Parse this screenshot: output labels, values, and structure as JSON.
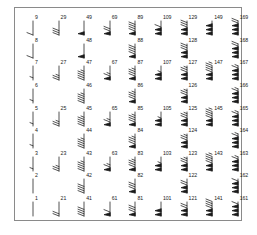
{
  "figure": {
    "kind": "wind-barb-grid",
    "frame_color": "#8a8a8a",
    "background_color": "#ffffff",
    "barb_color": "#1a1a1a",
    "label_color": "#1a1a1a"
  },
  "chart_data": {
    "type": "scatter",
    "title": "",
    "subtitle": "",
    "xlabel": "",
    "ylabel": "",
    "grid": false,
    "legend": "none",
    "xlim": [
      0,
      9
    ],
    "ylim": [
      0,
      9
    ],
    "xticks": [],
    "yticks": [],
    "marker": "wind-barb",
    "annotation_note": "Each marker is a meteorological wind barb labelled with its index value. Index increases bottom-to-top within a column and by 20 across columns.",
    "columns": [
      {
        "col": 1,
        "base": 1,
        "dense": true
      },
      {
        "col": 2,
        "base": 21,
        "dense": false
      },
      {
        "col": 3,
        "base": 41,
        "dense": true
      },
      {
        "col": 4,
        "base": 61,
        "dense": false
      },
      {
        "col": 5,
        "base": 81,
        "dense": true
      },
      {
        "col": 6,
        "base": 101,
        "dense": false
      },
      {
        "col": 7,
        "base": 121,
        "dense": true
      },
      {
        "col": 8,
        "base": 141,
        "dense": false
      },
      {
        "col": 9,
        "base": 161,
        "dense": true
      }
    ],
    "rows": [
      {
        "row": 9,
        "offset": 8,
        "labels": [
          9,
          29,
          49,
          69,
          89,
          109,
          129,
          149,
          169
        ]
      },
      {
        "row": 8,
        "offset": 7,
        "labels": [
          8,
          null,
          48,
          null,
          88,
          null,
          128,
          null,
          168
        ]
      },
      {
        "row": 7,
        "offset": 6,
        "labels": [
          7,
          27,
          47,
          67,
          87,
          107,
          127,
          147,
          167
        ]
      },
      {
        "row": 6,
        "offset": 5,
        "labels": [
          6,
          null,
          46,
          null,
          86,
          null,
          126,
          null,
          166
        ]
      },
      {
        "row": 5,
        "offset": 4,
        "labels": [
          5,
          25,
          45,
          65,
          85,
          105,
          125,
          145,
          165
        ]
      },
      {
        "row": 4,
        "offset": 3,
        "labels": [
          4,
          null,
          44,
          null,
          84,
          null,
          124,
          null,
          164
        ]
      },
      {
        "row": 3,
        "offset": 2,
        "labels": [
          3,
          23,
          43,
          63,
          83,
          103,
          123,
          143,
          163
        ]
      },
      {
        "row": 2,
        "offset": 1,
        "labels": [
          2,
          null,
          42,
          null,
          82,
          null,
          122,
          null,
          162
        ]
      },
      {
        "row": 1,
        "offset": 0,
        "labels": [
          1,
          21,
          41,
          61,
          81,
          101,
          121,
          141,
          161
        ]
      }
    ],
    "points": [
      {
        "label": "9",
        "col": 1,
        "row": 9,
        "speed": 9
      },
      {
        "label": "29",
        "col": 2,
        "row": 9,
        "speed": 29
      },
      {
        "label": "49",
        "col": 3,
        "row": 9,
        "speed": 49
      },
      {
        "label": "69",
        "col": 4,
        "row": 9,
        "speed": 69
      },
      {
        "label": "89",
        "col": 5,
        "row": 9,
        "speed": 89
      },
      {
        "label": "109",
        "col": 6,
        "row": 9,
        "speed": 109
      },
      {
        "label": "129",
        "col": 7,
        "row": 9,
        "speed": 129
      },
      {
        "label": "149",
        "col": 8,
        "row": 9,
        "speed": 149
      },
      {
        "label": "169",
        "col": 9,
        "row": 9,
        "speed": 169
      },
      {
        "label": "8",
        "col": 1,
        "row": 8,
        "speed": 8
      },
      {
        "label": "48",
        "col": 3,
        "row": 8,
        "speed": 48
      },
      {
        "label": "88",
        "col": 5,
        "row": 8,
        "speed": 88
      },
      {
        "label": "128",
        "col": 7,
        "row": 8,
        "speed": 128
      },
      {
        "label": "168",
        "col": 9,
        "row": 8,
        "speed": 168
      },
      {
        "label": "7",
        "col": 1,
        "row": 7,
        "speed": 7
      },
      {
        "label": "27",
        "col": 2,
        "row": 7,
        "speed": 27
      },
      {
        "label": "47",
        "col": 3,
        "row": 7,
        "speed": 47
      },
      {
        "label": "67",
        "col": 4,
        "row": 7,
        "speed": 67
      },
      {
        "label": "87",
        "col": 5,
        "row": 7,
        "speed": 87
      },
      {
        "label": "107",
        "col": 6,
        "row": 7,
        "speed": 107
      },
      {
        "label": "127",
        "col": 7,
        "row": 7,
        "speed": 127
      },
      {
        "label": "147",
        "col": 8,
        "row": 7,
        "speed": 147
      },
      {
        "label": "167",
        "col": 9,
        "row": 7,
        "speed": 167
      },
      {
        "label": "6",
        "col": 1,
        "row": 6,
        "speed": 6
      },
      {
        "label": "46",
        "col": 3,
        "row": 6,
        "speed": 46
      },
      {
        "label": "86",
        "col": 5,
        "row": 6,
        "speed": 86
      },
      {
        "label": "126",
        "col": 7,
        "row": 6,
        "speed": 126
      },
      {
        "label": "166",
        "col": 9,
        "row": 6,
        "speed": 166
      },
      {
        "label": "5",
        "col": 1,
        "row": 5,
        "speed": 5
      },
      {
        "label": "25",
        "col": 2,
        "row": 5,
        "speed": 25
      },
      {
        "label": "45",
        "col": 3,
        "row": 5,
        "speed": 45
      },
      {
        "label": "65",
        "col": 4,
        "row": 5,
        "speed": 65
      },
      {
        "label": "85",
        "col": 5,
        "row": 5,
        "speed": 85
      },
      {
        "label": "105",
        "col": 6,
        "row": 5,
        "speed": 105
      },
      {
        "label": "125",
        "col": 7,
        "row": 5,
        "speed": 125
      },
      {
        "label": "145",
        "col": 8,
        "row": 5,
        "speed": 145
      },
      {
        "label": "165",
        "col": 9,
        "row": 5,
        "speed": 165
      },
      {
        "label": "4",
        "col": 1,
        "row": 4,
        "speed": 4
      },
      {
        "label": "44",
        "col": 3,
        "row": 4,
        "speed": 44
      },
      {
        "label": "84",
        "col": 5,
        "row": 4,
        "speed": 84
      },
      {
        "label": "124",
        "col": 7,
        "row": 4,
        "speed": 124
      },
      {
        "label": "164",
        "col": 9,
        "row": 4,
        "speed": 164
      },
      {
        "label": "3",
        "col": 1,
        "row": 3,
        "speed": 3
      },
      {
        "label": "23",
        "col": 2,
        "row": 3,
        "speed": 23
      },
      {
        "label": "43",
        "col": 3,
        "row": 3,
        "speed": 43
      },
      {
        "label": "63",
        "col": 4,
        "row": 3,
        "speed": 63
      },
      {
        "label": "83",
        "col": 5,
        "row": 3,
        "speed": 83
      },
      {
        "label": "103",
        "col": 6,
        "row": 3,
        "speed": 103
      },
      {
        "label": "123",
        "col": 7,
        "row": 3,
        "speed": 123
      },
      {
        "label": "143",
        "col": 8,
        "row": 3,
        "speed": 143
      },
      {
        "label": "163",
        "col": 9,
        "row": 3,
        "speed": 163
      },
      {
        "label": "2",
        "col": 1,
        "row": 2,
        "speed": 2
      },
      {
        "label": "42",
        "col": 3,
        "row": 2,
        "speed": 42
      },
      {
        "label": "82",
        "col": 5,
        "row": 2,
        "speed": 82
      },
      {
        "label": "122",
        "col": 7,
        "row": 2,
        "speed": 122
      },
      {
        "label": "162",
        "col": 9,
        "row": 2,
        "speed": 162
      },
      {
        "label": "1",
        "col": 1,
        "row": 1,
        "speed": 1
      },
      {
        "label": "21",
        "col": 2,
        "row": 1,
        "speed": 21
      },
      {
        "label": "41",
        "col": 3,
        "row": 1,
        "speed": 41
      },
      {
        "label": "61",
        "col": 4,
        "row": 1,
        "speed": 61
      },
      {
        "label": "81",
        "col": 5,
        "row": 1,
        "speed": 81
      },
      {
        "label": "101",
        "col": 6,
        "row": 1,
        "speed": 101
      },
      {
        "label": "121",
        "col": 7,
        "row": 1,
        "speed": 121
      },
      {
        "label": "141",
        "col": 8,
        "row": 1,
        "speed": 141
      },
      {
        "label": "161",
        "col": 9,
        "row": 1,
        "speed": 161
      }
    ]
  }
}
